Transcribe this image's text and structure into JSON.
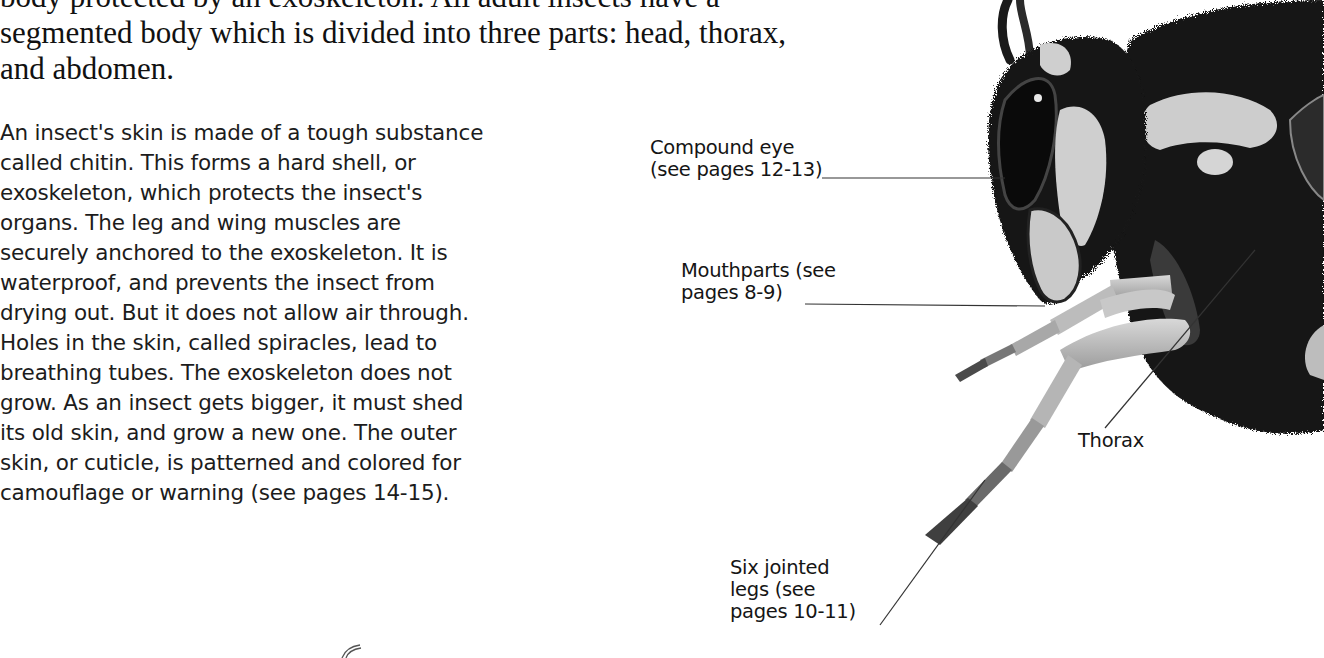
{
  "intro": {
    "lines": [
      "body protected by an exoskeleton. All adult insects have a",
      "segmented body which is divided into three parts: head, thorax,",
      "and abdomen."
    ]
  },
  "body": {
    "lines": [
      "An insect's skin is made of a tough substance",
      "called chitin. This forms a hard shell, or",
      "exoskeleton, which protects the insect's",
      "organs. The leg and wing muscles are",
      "securely anchored to the exoskeleton. It is",
      "waterproof, and prevents the insect from",
      "drying out. But it does not allow air through.",
      "Holes in the skin, called spiracles, lead to",
      "breathing tubes. The exoskeleton does not",
      "grow. As an insect gets bigger, it must shed",
      "its old skin, and grow a new one. The outer",
      "skin, or cuticle, is patterned and colored for",
      "camouflage or warning (see pages 14-15)."
    ]
  },
  "labels": {
    "compound_eye": {
      "lines": [
        "Compound eye",
        "(see pages 12-13)"
      ]
    },
    "mouthparts": {
      "lines": [
        "Mouthparts (see",
        "pages 8-9)"
      ]
    },
    "thorax": {
      "lines": [
        "Thorax"
      ]
    },
    "legs": {
      "lines": [
        "Six jointed",
        "legs (see",
        "pages 10-11)"
      ]
    }
  },
  "illustration": {
    "subject": "insect-head-and-thorax",
    "palette": {
      "dark": "#141414",
      "mid": "#6e6e6e",
      "light": "#cfcfcf",
      "leader": "#333333"
    }
  }
}
